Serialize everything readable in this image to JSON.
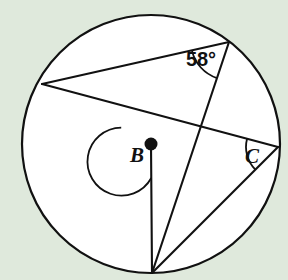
{
  "figure": {
    "background_color": "#dfe9dc",
    "stroke_color": "#111111",
    "fill_color": "#ffffff"
  },
  "circle": {
    "center_label": "B",
    "center_x": 151,
    "center_y": 144,
    "radius": 129,
    "stroke_width": 2.2
  },
  "points": {
    "center": {
      "name": "B",
      "x": 151,
      "y": 144
    },
    "left": {
      "name": "A",
      "x": 42,
      "y": 84
    },
    "apex": {
      "name": "D",
      "x": 229,
      "y": 42
    },
    "right": {
      "name": "C",
      "x": 278,
      "y": 147
    },
    "bottom": {
      "name": "E",
      "x": 152,
      "y": 273
    }
  },
  "labels": {
    "angle_inscribed_top": "58°",
    "vertex_center": "B",
    "vertex_right": "C"
  },
  "label_positions": {
    "angle_inscribed_top": {
      "x": 201,
      "y": 66,
      "font_size": 20
    },
    "vertex_center": {
      "x": 137,
      "y": 162,
      "font_size": 21
    },
    "vertex_right": {
      "x": 252,
      "y": 163,
      "font_size": 21
    }
  },
  "segments": [
    {
      "name": "chord-left-to-apex",
      "x1": 42,
      "y1": 84,
      "x2": 229,
      "y2": 42
    },
    {
      "name": "chord-left-to-right",
      "x1": 42,
      "y1": 84,
      "x2": 278,
      "y2": 147
    },
    {
      "name": "chord-apex-to-bottom",
      "x1": 229,
      "y1": 42,
      "x2": 152,
      "y2": 273
    },
    {
      "name": "radius-center-to-bottom",
      "x1": 151,
      "y1": 144,
      "x2": 152,
      "y2": 273
    },
    {
      "name": "chord-right-to-bottom",
      "x1": 278,
      "y1": 147,
      "x2": 152,
      "y2": 273
    }
  ],
  "arcs": {
    "angle_58_arc": {
      "name": "inscribed-angle-arc-58",
      "radius": 38
    },
    "angle_B_arc": {
      "name": "central-angle-arc-b",
      "radius": 34
    },
    "angle_C_arc": {
      "name": "inscribed-angle-arc-c",
      "radius": 32
    }
  },
  "chart_data": {
    "type": "diagram",
    "known_values": [
      {
        "label": "58°",
        "kind": "inscribed angle",
        "value": 58,
        "unit": "degrees"
      }
    ],
    "unknowns": [
      {
        "label": "B",
        "kind": "central angle"
      },
      {
        "label": "C",
        "kind": "inscribed angle"
      }
    ]
  }
}
